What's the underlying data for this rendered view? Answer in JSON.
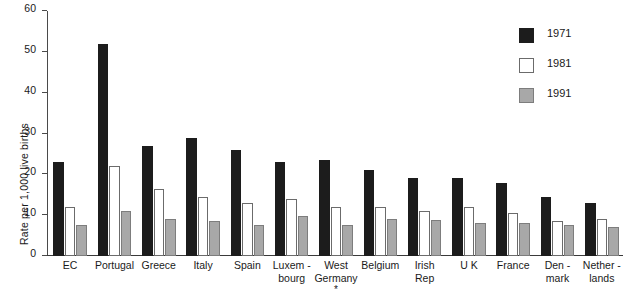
{
  "chart_data": {
    "type": "bar",
    "title": "",
    "subtitle": "",
    "xlabel": "",
    "ylabel": "Rate per 1,000 live births",
    "ylim": [
      0,
      60
    ],
    "yticks": [
      0,
      10,
      20,
      30,
      40,
      50,
      60
    ],
    "ytick_labels": [
      "0",
      "10",
      "20",
      "30",
      "40",
      "50",
      "60"
    ],
    "grid": false,
    "legend_position": "top-right",
    "categories": [
      "EC",
      "Portugal",
      "Greece",
      "Italy",
      "Spain",
      "Luxem -\nbourg",
      "West\nGermany",
      "Belgium",
      "Irish\nRep",
      "U K",
      "France",
      "Den -\nmark",
      "Nether -\nlands"
    ],
    "category_notes": {
      "West\nGermany": "*"
    },
    "series": [
      {
        "name": "1971",
        "color": "#1c1c1c",
        "values": [
          23,
          52,
          27,
          29,
          26,
          23,
          23.5,
          21,
          19,
          19,
          18,
          14.5,
          13
        ]
      },
      {
        "name": "1981",
        "color": "#ffffff",
        "values": [
          12,
          22,
          16.5,
          14.5,
          13,
          14,
          12,
          12,
          11,
          12,
          10.5,
          8.5,
          9
        ]
      },
      {
        "name": "1991",
        "color": "#a8a8a8",
        "values": [
          7.5,
          11,
          9,
          8.5,
          7.5,
          9.7,
          7.5,
          9,
          8.8,
          8,
          8,
          7.5,
          7
        ]
      }
    ]
  }
}
